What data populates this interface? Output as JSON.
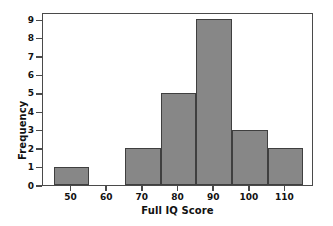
{
  "chart_data": {
    "type": "bar",
    "title": "",
    "subtitle": "",
    "xlabel": "Full IQ Score",
    "ylabel": "Frequency",
    "categories": [
      "45-55",
      "55-65",
      "65-75",
      "75-85",
      "85-95",
      "95-105",
      "105-115"
    ],
    "bin_centers": [
      50,
      60,
      70,
      80,
      90,
      100,
      110
    ],
    "bin_edges": [
      45,
      55,
      65,
      75,
      85,
      95,
      105,
      115
    ],
    "bin_width": 10,
    "values": [
      1,
      0,
      2,
      5,
      9,
      3,
      2
    ],
    "xlim": [
      42,
      118
    ],
    "ylim": [
      0,
      9.4
    ],
    "xticks": [
      50,
      60,
      70,
      80,
      90,
      100,
      110
    ],
    "xtick_labels": [
      "50",
      "60",
      "70",
      "80",
      "90",
      "100",
      "110"
    ],
    "yticks": [
      0,
      1,
      2,
      3,
      4,
      5,
      6,
      7,
      8,
      9
    ],
    "ytick_labels": [
      "0",
      "1",
      "2",
      "3",
      "4",
      "5",
      "6",
      "7",
      "8",
      "9"
    ],
    "grid": false,
    "legend": null,
    "bar_fill_color": "#878787",
    "bar_edge_color": "#3f3f3f",
    "axis_color": "#4a4a4a",
    "background_color": "#ffffff",
    "total_count": 22
  }
}
